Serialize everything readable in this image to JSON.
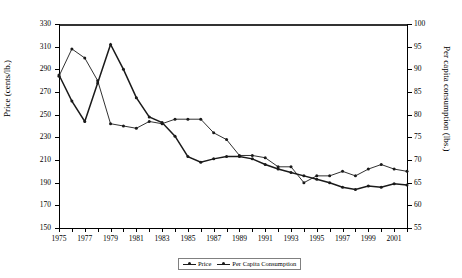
{
  "chart_data": {
    "type": "line",
    "title": "",
    "xlabel": "",
    "ylabel": "Price (cents/lb.)",
    "y2label": "Per capita consumption (lbs.)",
    "x": [
      1975,
      1976,
      1977,
      1978,
      1979,
      1980,
      1981,
      1982,
      1983,
      1984,
      1985,
      1986,
      1987,
      1988,
      1989,
      1990,
      1991,
      1992,
      1993,
      1994,
      1995,
      1996,
      1997,
      1998,
      1999,
      2000,
      2001,
      2002
    ],
    "xtick_labels": [
      "1975",
      "1977",
      "1979",
      "1981",
      "1983",
      "1985",
      "1987",
      "1989",
      "1991",
      "1993",
      "1995",
      "1997",
      "1999",
      "2001"
    ],
    "xlim": [
      1975,
      2002
    ],
    "ylim": [
      150,
      330
    ],
    "ytick_labels": [
      "150",
      "170",
      "190",
      "210",
      "230",
      "250",
      "270",
      "290",
      "310",
      "330"
    ],
    "y2lim": [
      55,
      100
    ],
    "y2tick_labels": [
      "55",
      "60",
      "65",
      "70",
      "75",
      "80",
      "85",
      "90",
      "95",
      "100"
    ],
    "grid": false,
    "legend_position": "bottom-center",
    "series": [
      {
        "name": "Price",
        "axis": "left",
        "unit": "cents/lb.",
        "values": [
          285,
          262,
          244,
          278,
          312,
          290,
          265,
          248,
          243,
          231,
          213,
          208,
          211,
          213,
          213,
          211,
          206,
          202,
          199,
          196,
          193,
          190,
          186,
          184,
          187,
          186,
          189,
          188
        ]
      },
      {
        "name": "Per Capita Consumption",
        "axis": "right",
        "unit": "lbs.",
        "values": [
          88.5,
          94.5,
          92.5,
          87.5,
          78.0,
          77.5,
          77.0,
          78.5,
          78.0,
          79.0,
          79.0,
          79.0,
          76.0,
          74.5,
          71.0,
          71.0,
          70.5,
          68.5,
          68.5,
          65.0,
          66.5,
          66.5,
          67.5,
          66.5,
          68.0,
          69.0,
          68.0,
          67.5
        ]
      }
    ]
  },
  "legend": {
    "entries": [
      {
        "label": "Price"
      },
      {
        "label": "Per Capita Consumption"
      }
    ]
  },
  "colors": {
    "series": "#1a1a1a",
    "axis": "#000000",
    "legend_border": "#808080"
  }
}
